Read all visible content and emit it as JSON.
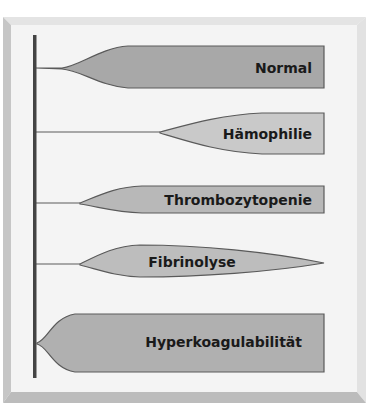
{
  "diagram": {
    "colors": {
      "frame_top": "#e4e4e4",
      "frame_left": "#c6c6c6",
      "frame_right": "#e2e2e2",
      "frame_bottom": "#bcbcbc",
      "panel": "#f4f4f4",
      "axis": "#444444",
      "outline": "#5a5a5a"
    },
    "rows": [
      {
        "label": "Normal",
        "fill": "#a8a8a8"
      },
      {
        "label": "Hämophilie",
        "fill": "#c9c9c9"
      },
      {
        "label": "Thrombozytopenie",
        "fill": "#b8b8b8"
      },
      {
        "label": "Fibrinolyse",
        "fill": "#bdbdbd"
      },
      {
        "label": "Hyperkoagulabilität",
        "fill": "#b0b0b0"
      }
    ]
  }
}
